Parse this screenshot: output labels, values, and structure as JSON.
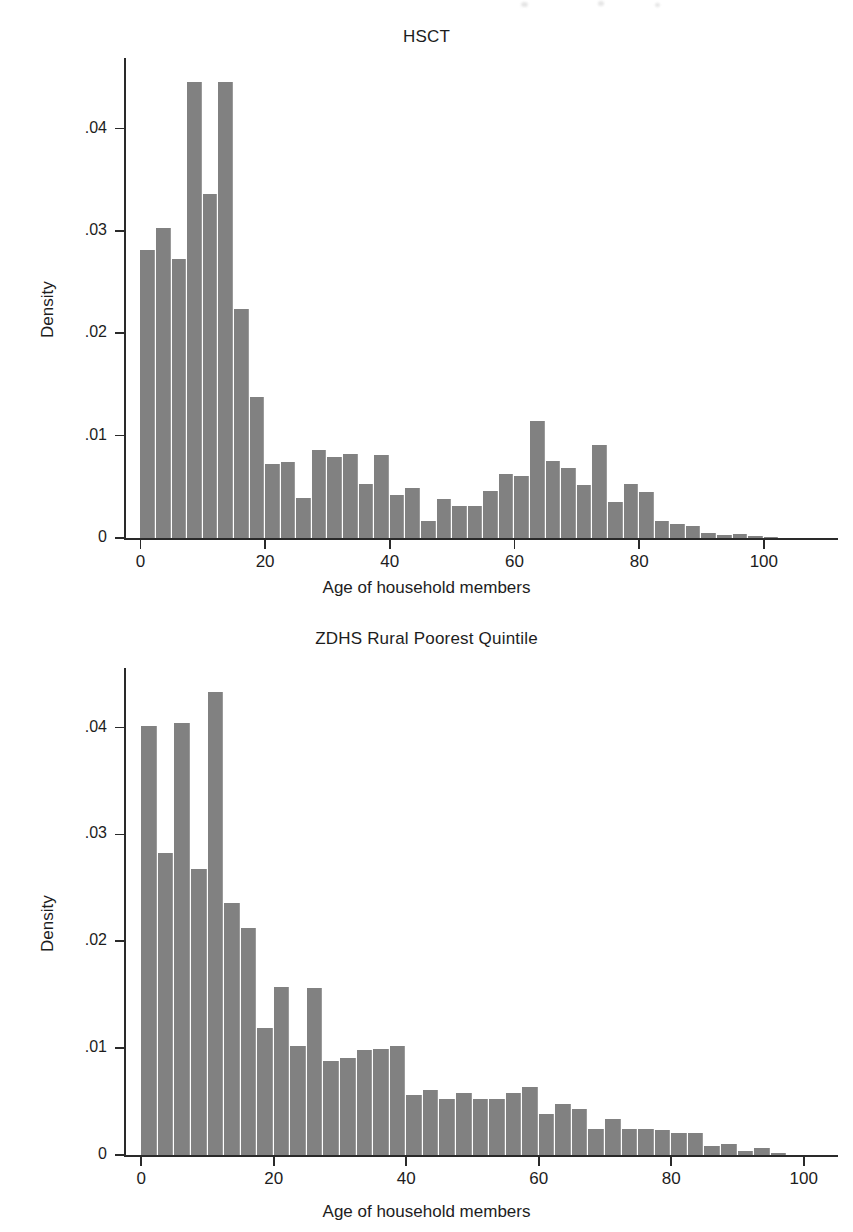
{
  "page": {
    "background": "#ffffff",
    "bar_color": "#818181",
    "axis_color": "#2a2a2a"
  },
  "chart_data": [
    {
      "id": "hsct",
      "type": "bar",
      "title": "HSCT",
      "xlabel": "Age of household members",
      "ylabel": "Density",
      "xlim": [
        -2,
        105
      ],
      "ylim": [
        0,
        0.0465
      ],
      "xticks": [
        0,
        20,
        40,
        60,
        80,
        100
      ],
      "xticklabels": [
        "0",
        "20",
        "40",
        "60",
        "80",
        "100"
      ],
      "yticks": [
        0,
        0.01,
        0.02,
        0.03,
        0.04
      ],
      "yticklabels": [
        "0",
        ".01",
        ".02",
        ".03",
        ".04"
      ],
      "grid": false,
      "legend": null,
      "bin_width": 2.5,
      "bin_starts": [
        0,
        2.5,
        5,
        7.5,
        10,
        12.5,
        15,
        17.5,
        20,
        22.5,
        25,
        27.5,
        30,
        32.5,
        35,
        37.5,
        40,
        42.5,
        45,
        47.5,
        50,
        52.5,
        55,
        57.5,
        60,
        62.5,
        65,
        67.5,
        70,
        72.5,
        75,
        77.5,
        80,
        82.5,
        85,
        87.5,
        90,
        92.5,
        95,
        97.5,
        100
      ],
      "values": [
        0.0281,
        0.0303,
        0.0273,
        0.0445,
        0.0336,
        0.0445,
        0.0224,
        0.0138,
        0.0072,
        0.0074,
        0.0039,
        0.0086,
        0.0079,
        0.0082,
        0.0053,
        0.0081,
        0.0042,
        0.0049,
        0.0017,
        0.0038,
        0.0031,
        0.0031,
        0.0046,
        0.0063,
        0.0061,
        0.0114,
        0.0075,
        0.0068,
        0.0052,
        0.0091,
        0.0035,
        0.0053,
        0.0045,
        0.0017,
        0.0014,
        0.0012,
        0.0005,
        0.0003,
        0.0004,
        0.0002,
        0.0001
      ]
    },
    {
      "id": "zdhs",
      "type": "bar",
      "title": "ZDHS Rural Poorest Quintile",
      "xlabel": "Age of household members",
      "ylabel": "Density",
      "xlim": [
        -2,
        102
      ],
      "ylim": [
        0,
        0.0452
      ],
      "xticks": [
        0,
        20,
        40,
        60,
        80,
        100
      ],
      "xticklabels": [
        "0",
        "20",
        "40",
        "60",
        "80",
        "100"
      ],
      "yticks": [
        0,
        0.01,
        0.02,
        0.03,
        0.04
      ],
      "yticklabels": [
        "0",
        ".01",
        ".02",
        ".03",
        ".04"
      ],
      "grid": false,
      "legend": null,
      "bin_width": 2.5,
      "bin_starts": [
        0,
        2.5,
        5,
        7.5,
        10,
        12.5,
        15,
        17.5,
        20,
        22.5,
        25,
        27.5,
        30,
        32.5,
        35,
        37.5,
        40,
        42.5,
        45,
        47.5,
        50,
        52.5,
        55,
        57.5,
        60,
        62.5,
        65,
        67.5,
        70,
        72.5,
        75,
        77.5,
        80,
        82.5,
        85,
        87.5,
        90,
        92.5,
        95
      ],
      "values": [
        0.0401,
        0.0283,
        0.0404,
        0.0268,
        0.0433,
        0.0236,
        0.0212,
        0.0119,
        0.0157,
        0.0102,
        0.0156,
        0.0088,
        0.0091,
        0.0098,
        0.0099,
        0.0102,
        0.0056,
        0.0061,
        0.0052,
        0.0058,
        0.0052,
        0.0052,
        0.0058,
        0.0064,
        0.0038,
        0.0048,
        0.0043,
        0.0024,
        0.0034,
        0.0024,
        0.0024,
        0.0023,
        0.0021,
        0.0021,
        0.0008,
        0.001,
        0.0004,
        0.0007,
        0.0002
      ]
    }
  ]
}
